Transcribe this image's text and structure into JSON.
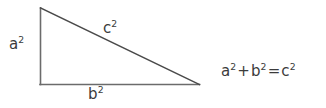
{
  "figure": {
    "background_color": "#ffffff",
    "stroke_color": "#6b6b6b",
    "text_color": "#3b3b3b"
  },
  "triangle": {
    "shape": "right-triangle",
    "vertices": {
      "apex": [
        40,
        8
      ],
      "right_angle": [
        40,
        84
      ],
      "base_right": [
        199,
        84
      ]
    },
    "sides": [
      {
        "name": "vertical-leg",
        "label_base": "a",
        "label_exponent": "2"
      },
      {
        "name": "horizontal-leg",
        "label_base": "b",
        "label_exponent": "2"
      },
      {
        "name": "hypotenuse",
        "label_base": "c",
        "label_exponent": "2"
      }
    ]
  },
  "labels": {
    "leg_a": {
      "base": "a",
      "exponent": "2"
    },
    "leg_b": {
      "base": "b",
      "exponent": "2"
    },
    "hypotenuse_c": {
      "base": "c",
      "exponent": "2"
    }
  },
  "equation": {
    "full_text": "a² + b² = c²",
    "term_a_base": "a",
    "term_a_exponent": "2",
    "plus_sign": "+",
    "term_b_base": "b",
    "term_b_exponent": "2",
    "equals_sign": "=",
    "term_c_base": "c",
    "term_c_exponent": "2"
  }
}
